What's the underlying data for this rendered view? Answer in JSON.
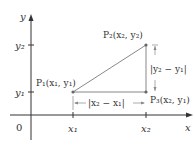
{
  "diagram": {
    "axes": {
      "x_label": "x",
      "y_label": "y",
      "origin_label": "0"
    },
    "ticks": {
      "x1": "x₁",
      "x2": "x₂",
      "y1": "y₁",
      "y2": "y₂"
    },
    "points": {
      "P1": "P₁(x₁, y₁)",
      "P2": "P₂(x₂, y₂)",
      "P3": "P₃(x₂, y₁)"
    },
    "distances": {
      "horizontal": "|x₂ − x₁|",
      "vertical": "|y₂ − y₁|"
    },
    "colors": {
      "axis": "#333333",
      "triangle": "#888888",
      "point": "#666666"
    }
  }
}
